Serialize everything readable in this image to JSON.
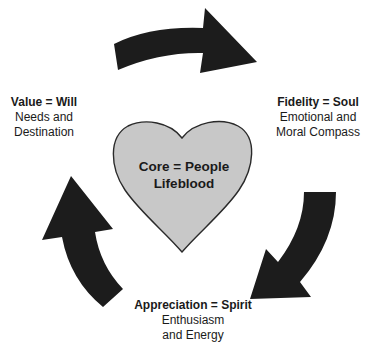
{
  "core": {
    "line1": "Core = People",
    "line2": "Lifeblood",
    "fill_color": "#c8c8c8"
  },
  "nodes": [
    {
      "id": "value",
      "title": "Value = Will",
      "line1": "Needs and",
      "line2": "Destination"
    },
    {
      "id": "fidelity",
      "title": "Fidelity = Soul",
      "line1": "Emotional and",
      "line2": "Moral Compass"
    },
    {
      "id": "appreciation",
      "title": "Appreciation = Spirit",
      "line1": "Enthusiasm",
      "line2": "and Energy"
    }
  ],
  "arrows": [
    {
      "from": "value",
      "to": "fidelity",
      "direction": "clockwise"
    },
    {
      "from": "fidelity",
      "to": "appreciation",
      "direction": "clockwise"
    },
    {
      "from": "appreciation",
      "to": "value",
      "direction": "clockwise"
    }
  ],
  "colors": {
    "arrow": "#1c1c1c",
    "heart_fill": "#c8c8c8",
    "heart_stroke": "#2a2a2a",
    "text": "#1a1a1a",
    "background": "#ffffff"
  }
}
